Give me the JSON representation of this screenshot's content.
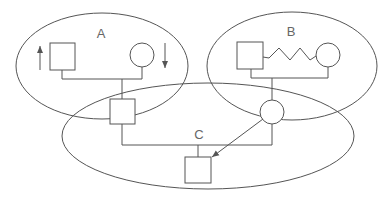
{
  "diagram": {
    "type": "pedigree-groups",
    "colors": {
      "stroke": "#555555",
      "label": "#666666",
      "background": "#ffffff"
    },
    "groups": [
      {
        "id": "A",
        "label": "A"
      },
      {
        "id": "B",
        "label": "B"
      },
      {
        "id": "C",
        "label": "C"
      }
    ],
    "nodes": [
      {
        "id": "a_male",
        "shape": "square",
        "group": "A",
        "annotation": "up-arrow"
      },
      {
        "id": "a_female",
        "shape": "circle",
        "group": "A",
        "annotation": "down-arrow"
      },
      {
        "id": "ac_male",
        "shape": "square",
        "groups": [
          "A",
          "C"
        ]
      },
      {
        "id": "b_male",
        "shape": "square",
        "group": "B"
      },
      {
        "id": "b_female",
        "shape": "circle",
        "group": "B"
      },
      {
        "id": "bc_female",
        "shape": "circle",
        "groups": [
          "B",
          "C"
        ]
      },
      {
        "id": "c_child",
        "shape": "square",
        "group": "C"
      }
    ],
    "edges": [
      {
        "from": "a_male",
        "to": "a_female",
        "type": "mating"
      },
      {
        "from": "a_male+a_female",
        "to": "ac_male",
        "type": "descent"
      },
      {
        "from": "b_male",
        "to": "b_female",
        "type": "conflictual-zigzag"
      },
      {
        "from": "b_male+b_female",
        "to": "bc_female",
        "type": "descent"
      },
      {
        "from": "ac_male",
        "to": "bc_female",
        "type": "mating"
      },
      {
        "from": "ac_male+bc_female",
        "to": "c_child",
        "type": "descent"
      },
      {
        "from": "bc_female",
        "to": "c_child",
        "type": "directed-arrow"
      }
    ]
  }
}
